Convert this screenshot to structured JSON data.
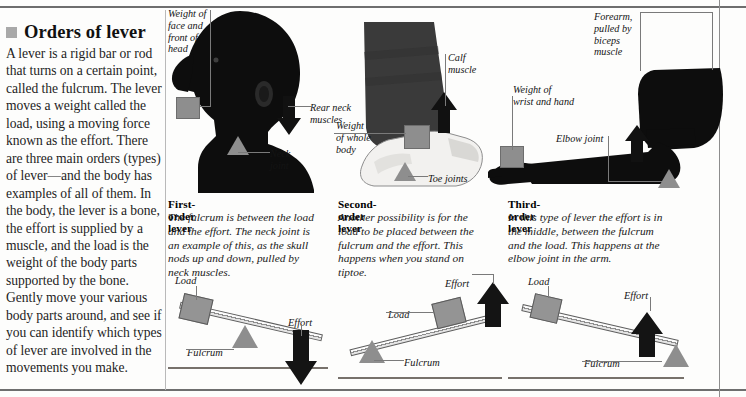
{
  "article": {
    "bullet_icon": "square-bullet",
    "title": "Orders of lever",
    "body": "A lever is a rigid bar or rod that turns on a certain point, called the fulcrum. The lever moves a weight called the load, using a moving force known as the effort. There are three main orders (types) of lever—and the body has examples of all of them. In the body, the lever is a bone, the effort is supplied by a muscle, and the load is the weight of the body parts supported by the bone. Gently move your various body parts around, and see if you can identify which types of lever are involved in the movements you make."
  },
  "panels": [
    {
      "id": "first-order",
      "caption_title": "First-order lever",
      "caption_body": "The fulcrum is between the load and the effort. The neck joint is an example of this, as the skull nods up and down, pulled by neck muscles.",
      "art_name": "head-and-neck-silhouette",
      "labels": [
        {
          "name": "weight-of-face-and-front-of-head",
          "text": "Weight of\nface and\nfront of\nhead"
        },
        {
          "name": "rear-neck-muscles",
          "text": "Rear neck\nmuscles"
        },
        {
          "name": "neck-joint",
          "text": "Neck\njoint"
        }
      ],
      "schematic": {
        "type": "first-order",
        "load_label": "Load",
        "fulcrum_label": "Fulcrum",
        "effort_label": "Effort",
        "order": "load - fulcrum - effort",
        "effort_direction": "down"
      }
    },
    {
      "id": "second-order",
      "caption_title": "Second-order lever",
      "caption_body": "Another possibility is for the load to be placed between the fulcrum and the effort. This happens when you stand on tiptoe.",
      "art_name": "leg-on-tiptoe-silhouette",
      "labels": [
        {
          "name": "calf-muscle",
          "text": "Calf\nmuscle"
        },
        {
          "name": "weight-of-whole-body",
          "text": "Weight\nof whole\nbody"
        },
        {
          "name": "toe-joints",
          "text": "Toe joints"
        }
      ],
      "schematic": {
        "type": "second-order",
        "load_label": "Load",
        "fulcrum_label": "Fulcrum",
        "effort_label": "Effort",
        "order": "fulcrum - load - effort",
        "effort_direction": "up"
      }
    },
    {
      "id": "third-order",
      "caption_title": "Third-order lever",
      "caption_body": "In this type of lever the effort is in the middle, between the fulcrum and the load. This happens at the elbow joint in the arm.",
      "art_name": "arm-and-elbow-silhouette",
      "labels": [
        {
          "name": "forearm-pulled-by-biceps-muscle",
          "text": "Forearm,\npulled by\nbiceps\nmuscle"
        },
        {
          "name": "weight-of-wrist-and-hand",
          "text": "Weight of\nwrist and hand"
        },
        {
          "name": "elbow-joint",
          "text": "Elbow joint"
        }
      ],
      "schematic": {
        "type": "third-order",
        "load_label": "Load",
        "fulcrum_label": "Fulcrum",
        "effort_label": "Effort",
        "order": "load - effort - fulcrum",
        "effort_direction": "up"
      }
    }
  ],
  "colors": {
    "load_gray": "#949494",
    "fulcrum_gray": "#8e8e8e",
    "effort_black": "#141414",
    "rule_gray": "#6e6e6e",
    "silhouette_black": "#0d0d0d"
  }
}
